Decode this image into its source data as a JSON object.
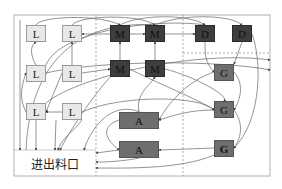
{
  "diagram": {
    "inlet_label": "进出料口",
    "colors": {
      "L_fill": "#e8e8e8",
      "M_fill": "#3e3e3e",
      "D_fill": "#3e3e3e",
      "G_fill": "#6e6e6e",
      "A_fill": "#6e6e6e",
      "frame": "#b0b0b0",
      "edge": "#555555"
    },
    "nodes": [
      {
        "id": "L1",
        "label": "L",
        "type": "L",
        "x": 26,
        "y": 25,
        "w": 20,
        "h": 17
      },
      {
        "id": "L2",
        "label": "L",
        "type": "L",
        "x": 62,
        "y": 25,
        "w": 20,
        "h": 17
      },
      {
        "id": "L3",
        "label": "L",
        "type": "L",
        "x": 26,
        "y": 65,
        "w": 20,
        "h": 17
      },
      {
        "id": "L4",
        "label": "L",
        "type": "L",
        "x": 62,
        "y": 65,
        "w": 20,
        "h": 17
      },
      {
        "id": "L5",
        "label": "L",
        "type": "L",
        "x": 26,
        "y": 103,
        "w": 20,
        "h": 17
      },
      {
        "id": "L6",
        "label": "L",
        "type": "L",
        "x": 62,
        "y": 103,
        "w": 20,
        "h": 17
      },
      {
        "id": "M1",
        "label": "M",
        "type": "M",
        "x": 110,
        "y": 25,
        "w": 20,
        "h": 17
      },
      {
        "id": "M2",
        "label": "M",
        "type": "M",
        "x": 145,
        "y": 25,
        "w": 20,
        "h": 17
      },
      {
        "id": "M3",
        "label": "M",
        "type": "M",
        "x": 110,
        "y": 60,
        "w": 20,
        "h": 17
      },
      {
        "id": "M4",
        "label": "M",
        "type": "M",
        "x": 145,
        "y": 60,
        "w": 20,
        "h": 17
      },
      {
        "id": "D1",
        "label": "D",
        "type": "D",
        "x": 195,
        "y": 25,
        "w": 20,
        "h": 17
      },
      {
        "id": "D2",
        "label": "D",
        "type": "D",
        "x": 232,
        "y": 25,
        "w": 20,
        "h": 17
      },
      {
        "id": "G1",
        "label": "G",
        "type": "G",
        "x": 214,
        "y": 64,
        "w": 20,
        "h": 17
      },
      {
        "id": "G2",
        "label": "G",
        "type": "G",
        "x": 214,
        "y": 101,
        "w": 20,
        "h": 17
      },
      {
        "id": "G3",
        "label": "G",
        "type": "G",
        "x": 214,
        "y": 140,
        "w": 20,
        "h": 17
      },
      {
        "id": "A1",
        "label": "A",
        "type": "A",
        "x": 119,
        "y": 112,
        "w": 40,
        "h": 17
      },
      {
        "id": "A2",
        "label": "A",
        "type": "A",
        "x": 119,
        "y": 141,
        "w": 40,
        "h": 17
      }
    ]
  }
}
